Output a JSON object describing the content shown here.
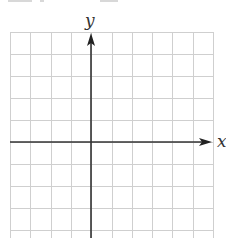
{
  "diagram": {
    "type": "blank coordinate grid",
    "x_axis_label": "x",
    "y_axis_label": "y",
    "grid": {
      "left": 10,
      "right": 213,
      "top": 32,
      "bottom": 238,
      "columns": 10,
      "column_spacing": 20.3,
      "row_spacing": 21.9,
      "line_color": "#cfcfcf"
    },
    "axes": {
      "origin_x": 91,
      "origin_y": 142,
      "color": "#333333",
      "x_arrow_tip": 212,
      "y_arrow_tip": 33
    },
    "tick_labels": [],
    "plotted_points": []
  }
}
